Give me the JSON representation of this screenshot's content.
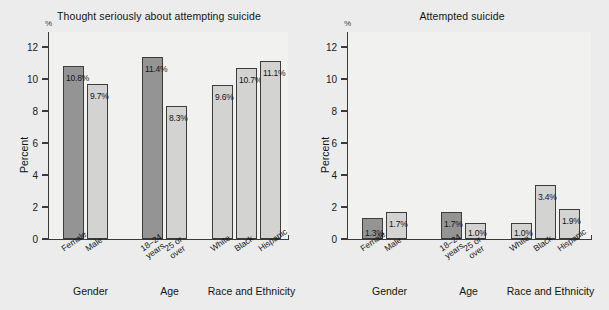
{
  "figure": {
    "background": "#ebeceb",
    "plot_background": "#f1f1f0",
    "axis_color": "#3a3a3a",
    "bar_dark": "#949494",
    "bar_light": "#d3d3d2",
    "shadow_color": "#b9b9b7"
  },
  "chart_data": [
    {
      "type": "bar",
      "title": "Thought seriously about attempting suicide",
      "xlabel": "",
      "ylabel": "Percent",
      "unit_mark": "%",
      "ylim": [
        0,
        13
      ],
      "yticks": [
        0,
        2,
        4,
        6,
        8,
        10,
        12
      ],
      "ytick_labels": [
        "0",
        "2",
        "4",
        "6",
        "8",
        "10",
        "12"
      ],
      "grid": false,
      "legend": "none",
      "groups": [
        {
          "name": "Gender",
          "categories": [
            "Female",
            "Male"
          ],
          "values": [
            10.8,
            9.7
          ],
          "data_labels": [
            "10.8%",
            "9.7%"
          ],
          "shades": [
            "dark",
            "light"
          ]
        },
        {
          "name": "Age",
          "categories": [
            "18–24\nyears",
            "25 or\nover"
          ],
          "values": [
            11.4,
            8.3
          ],
          "data_labels": [
            "11.4%",
            "8.3%"
          ],
          "shades": [
            "dark",
            "light"
          ]
        },
        {
          "name": "Race and Ethnicity",
          "categories": [
            "White",
            "Black",
            "Hispanic"
          ],
          "values": [
            9.6,
            10.7,
            11.1
          ],
          "data_labels": [
            "9.6%",
            "10.7%",
            "11.1%"
          ],
          "shades": [
            "light",
            "light",
            "light"
          ]
        }
      ]
    },
    {
      "type": "bar",
      "title": "Attempted suicide",
      "xlabel": "",
      "ylabel": "Percent",
      "unit_mark": "%",
      "ylim": [
        0,
        13
      ],
      "yticks": [
        0,
        2,
        4,
        6,
        8,
        10,
        12
      ],
      "ytick_labels": [
        "0",
        "2",
        "4",
        "6",
        "8",
        "10",
        "12"
      ],
      "grid": false,
      "legend": "none",
      "groups": [
        {
          "name": "Gender",
          "categories": [
            "Female",
            "Male"
          ],
          "values": [
            1.3,
            1.7
          ],
          "data_labels": [
            "1.3%",
            "1.7%"
          ],
          "shades": [
            "dark",
            "light"
          ]
        },
        {
          "name": "Age",
          "categories": [
            "18–24\nyears",
            "25 or\nover"
          ],
          "values": [
            1.7,
            1.0
          ],
          "data_labels": [
            "1.7%",
            "1.0%"
          ],
          "shades": [
            "dark",
            "light"
          ]
        },
        {
          "name": "Race and Ethnicity",
          "categories": [
            "White",
            "Black",
            "Hispanic"
          ],
          "values": [
            1.0,
            3.4,
            1.9
          ],
          "data_labels": [
            "1.0%",
            "3.4%",
            "1.9%"
          ],
          "shades": [
            "light",
            "light",
            "light"
          ]
        }
      ]
    }
  ]
}
